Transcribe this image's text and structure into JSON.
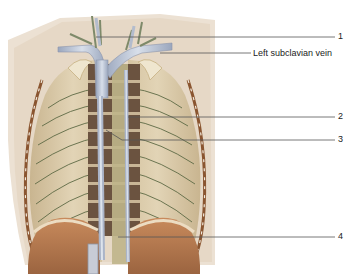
{
  "figure": {
    "labels": [
      {
        "id": "1",
        "text": "1",
        "x": 338,
        "y": 31
      },
      {
        "id": "left-subclavian-vein",
        "text": "Left subclavian vein",
        "x": 253,
        "y": 48
      },
      {
        "id": "2",
        "text": "2",
        "x": 338,
        "y": 111
      },
      {
        "id": "3",
        "text": "3",
        "x": 338,
        "y": 134
      },
      {
        "id": "4",
        "text": "4",
        "x": 338,
        "y": 231
      }
    ],
    "colors": {
      "background": "#ffffff",
      "thorax_outer": "#e9dccd",
      "rib_cage": "#d8c8a8",
      "vertebra": "#5a4535",
      "vein": "#b9c3d4",
      "nerve": "#7a8a5a",
      "diaphragm": "#b87a4e",
      "leader_line": "#555555"
    }
  }
}
